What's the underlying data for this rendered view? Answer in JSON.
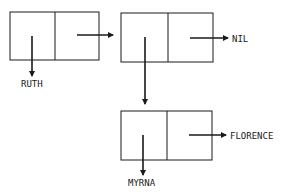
{
  "diagram": {
    "type": "linked-list-cons-cells",
    "nodes": [
      {
        "id": "cell1",
        "car": "RUTH",
        "cdr": "cell2"
      },
      {
        "id": "cell2",
        "car": "cell3",
        "cdr": "NIL"
      },
      {
        "id": "cell3",
        "car": "MYRNA",
        "cdr": "FLORENCE"
      }
    ],
    "labels": {
      "ruth": "RUTH",
      "nil": "NIL",
      "florence": "FLORENCE",
      "myrna": "MYRNA"
    },
    "colors": {
      "stroke": "#1a1a1a",
      "background": "#ffffff"
    }
  }
}
